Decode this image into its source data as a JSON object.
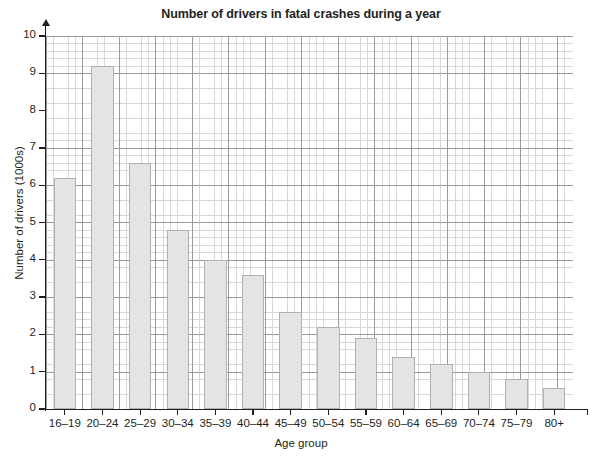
{
  "chart_data": {
    "type": "bar",
    "title": "Number of drivers in fatal crashes during a year",
    "xlabel": "Age group",
    "ylabel": "Number of drivers (1000s)",
    "categories": [
      "16–19",
      "20–24",
      "25–29",
      "30–34",
      "35–39",
      "40–44",
      "45–49",
      "50–54",
      "55–59",
      "60–64",
      "65–69",
      "70–74",
      "75–79",
      "80+"
    ],
    "values": [
      6.2,
      9.2,
      6.6,
      4.8,
      4.0,
      3.6,
      2.6,
      2.2,
      1.9,
      1.4,
      1.2,
      1.0,
      0.8,
      0.55
    ],
    "ylim": [
      0,
      10
    ],
    "ytick_labels": [
      "0",
      "1",
      "2",
      "3",
      "4",
      "5",
      "6",
      "7",
      "8",
      "9",
      "10"
    ],
    "ytick_values": [
      0,
      1,
      2,
      3,
      4,
      5,
      6,
      7,
      8,
      9,
      10
    ],
    "y_minor_step": 0.2,
    "grid": "major and minor grid shown, graph-paper style",
    "legend": "none",
    "bar_fill_color": "#e4e4e4",
    "bar_edge_color": "#b0b0b0",
    "grid_major_color": "#9a9a9a",
    "grid_minor_color": "#d8d8d8",
    "axis_color": "#231f20",
    "background_color": "#ffffff"
  }
}
